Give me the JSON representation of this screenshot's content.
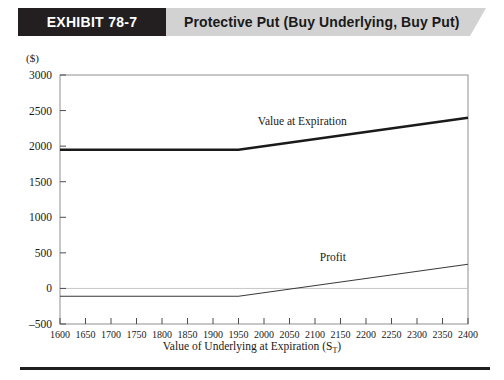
{
  "header": {
    "tag": "EXHIBIT 78-7",
    "title": "Protective Put (Buy Underlying, Buy Put)",
    "tag_bg": "#231f20",
    "band_bg": "#d2d2d2"
  },
  "axis": {
    "y_unit": "($)",
    "x_title_main": "Value of Underlying at Expiration (S",
    "x_title_sub": "T",
    "x_title_close": ")"
  },
  "chart_data": {
    "type": "line",
    "title": "Protective Put (Buy Underlying, Buy Put)",
    "xlabel": "Value of Underlying at Expiration (S_T)",
    "ylabel": "($)",
    "xlim": [
      1600,
      2400
    ],
    "ylim": [
      -500,
      3000
    ],
    "xticks": [
      1600,
      1650,
      1700,
      1750,
      1800,
      1850,
      1900,
      1950,
      2000,
      2050,
      2100,
      2150,
      2200,
      2250,
      2300,
      2350,
      2400
    ],
    "yticks": [
      -500,
      0,
      500,
      1000,
      1500,
      2000,
      2500,
      3000
    ],
    "grid": false,
    "zero_reference_line": 0,
    "strike": 1950,
    "legend": "inline-annotations",
    "series": [
      {
        "name": "Value  at Expiration",
        "style": "thick",
        "label_x": 2075,
        "label_y": 2300,
        "x": [
          1600,
          1950,
          2400
        ],
        "values": [
          1950,
          1950,
          2400
        ]
      },
      {
        "name": "Profit",
        "style": "thin",
        "label_x": 2135,
        "label_y": 390,
        "x": [
          1600,
          1950,
          2400
        ],
        "values": [
          -110,
          -110,
          340
        ]
      }
    ]
  }
}
